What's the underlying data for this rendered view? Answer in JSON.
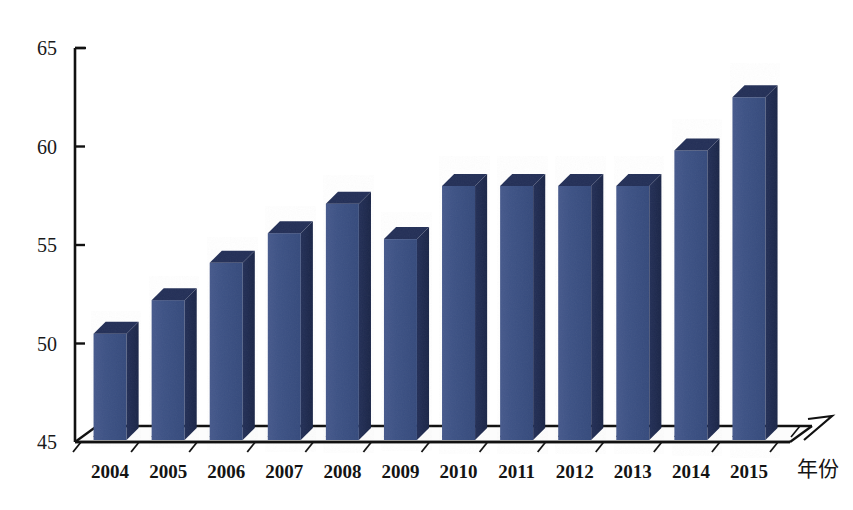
{
  "chart_data": {
    "type": "bar",
    "title": "",
    "subtitle": "",
    "xlabel": "年份",
    "ylabel": "",
    "categories": [
      "2004",
      "2005",
      "2006",
      "2007",
      "2008",
      "2009",
      "2010",
      "2011",
      "2012",
      "2013",
      "2014",
      "2015"
    ],
    "values": [
      50.5,
      52.2,
      54.1,
      55.6,
      57.1,
      55.3,
      58.0,
      58.0,
      58.0,
      58.0,
      59.8,
      62.5
    ],
    "ylim": [
      45,
      65
    ],
    "yticks": [
      45,
      50,
      55,
      60,
      65
    ],
    "ytick_labels": [
      "45",
      "50",
      "55",
      "60",
      "65"
    ],
    "grid": false,
    "legend": null,
    "legend_position": "none",
    "annotations": [],
    "style": {
      "bar_front_color": "#3d5385",
      "bar_side_color": "#1e2b50",
      "bar_top_color": "#232f57",
      "axis_color": "#111111",
      "background_color": "#ffffff",
      "three_d": true
    }
  },
  "axes": {
    "y_tick_labels": [
      "65",
      "60",
      "55",
      "50",
      "45"
    ],
    "x_axis_title": "年份"
  }
}
